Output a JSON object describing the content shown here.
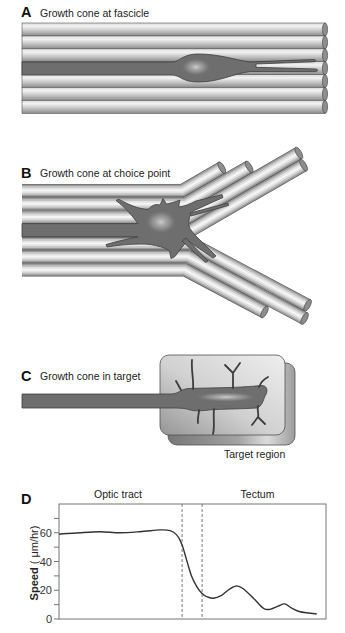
{
  "figure": {
    "panels": [
      {
        "letter": "A",
        "title": "Growth cone at fascicle"
      },
      {
        "letter": "B",
        "title": "Growth cone at choice point"
      },
      {
        "letter": "C",
        "title": "Growth cone in target",
        "target_label": "Target region"
      },
      {
        "letter": "D",
        "region_labels": [
          "Optic tract",
          "Tectum"
        ],
        "ylabel_bold": "Speed",
        "ylabel_unit": " ( μm/hr)"
      }
    ]
  },
  "colors": {
    "axon": "#6e6e6e",
    "outline": "#404040",
    "cap": "#8d8d8d",
    "chart-line": "#333333",
    "axis": "#747474",
    "text": "#222222"
  },
  "chart_data": {
    "type": "line",
    "title": "",
    "xlabel": "",
    "ylabel": "Speed (μm/hr)",
    "xlim": [
      0,
      100
    ],
    "ylim": [
      0,
      80
    ],
    "yticks": [
      0,
      10,
      20,
      30,
      40,
      50,
      60,
      70
    ],
    "ytick_labels": [
      "0",
      "20",
      "40",
      "60"
    ],
    "grid": false,
    "legend": "none",
    "regions": [
      {
        "label": "Optic tract",
        "x_range": [
          0,
          46.1
        ]
      },
      {
        "label": "Tectum",
        "x_range": [
          53.6,
          100
        ]
      }
    ],
    "boundary_lines": [
      46.1,
      53.6
    ],
    "series": [
      {
        "name": "Speed",
        "x": [
          0,
          7.9,
          15.4,
          22.8,
          30.3,
          37.8,
          41.6,
          44.1,
          46.0,
          47.8,
          49.7,
          51.6,
          53.4,
          55.3,
          57.8,
          60.9,
          64.0,
          66.6,
          69.0,
          72.8,
          76.5,
          79.0,
          82.1,
          84.6,
          87.2,
          90.3,
          96.5
        ],
        "values": [
          59,
          60,
          60.7,
          60,
          60.7,
          62,
          61.5,
          58.5,
          52,
          41,
          29.5,
          22.5,
          18,
          15.5,
          14.5,
          16.5,
          21,
          23,
          21,
          14.5,
          7.5,
          6.7,
          9,
          10.5,
          7.5,
          5,
          3.5
        ]
      }
    ]
  }
}
